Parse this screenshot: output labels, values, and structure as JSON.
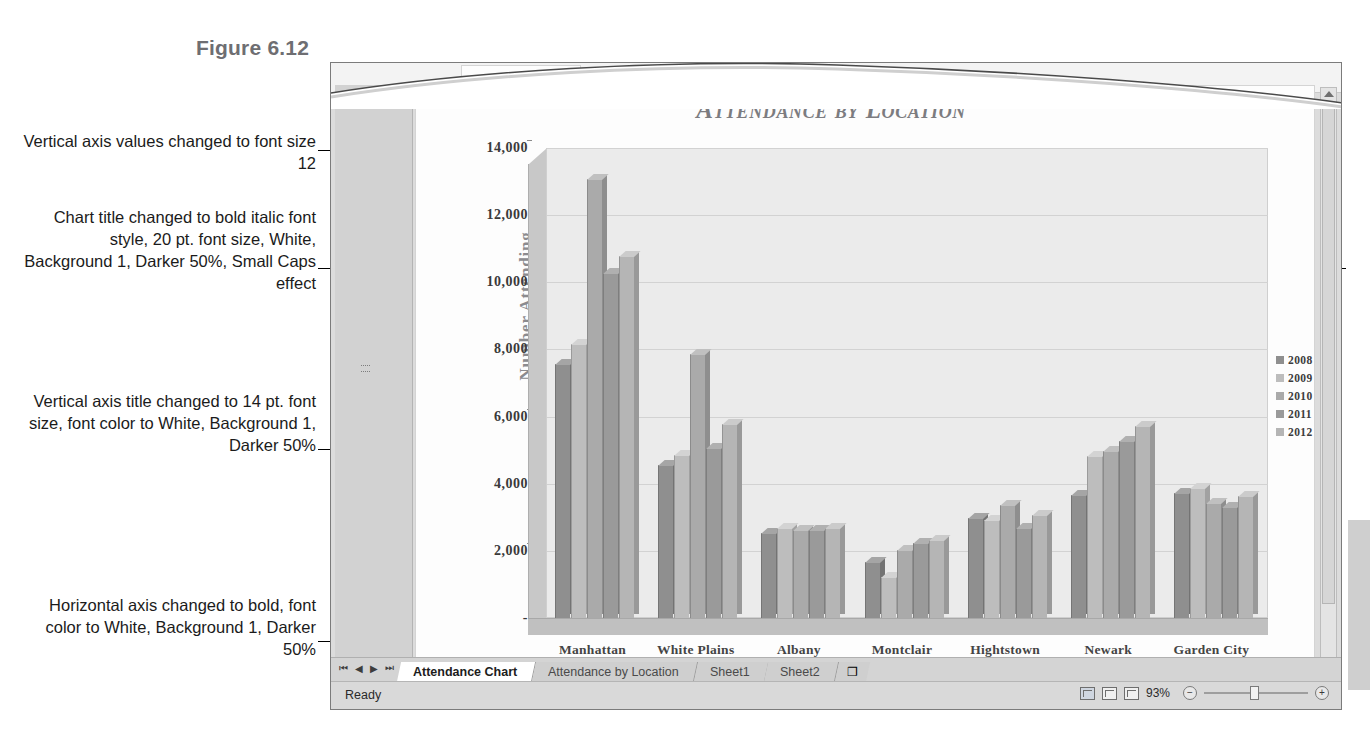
{
  "figure": {
    "label": "Figure 6.12"
  },
  "callouts": [
    {
      "id": "callout-0",
      "text": "Vertical axis values changed to font size 12"
    },
    {
      "id": "callout-1",
      "text": "Chart title changed to bold italic font style, 20 pt. font size, White, Background 1, Darker 50%, Small Caps effect"
    },
    {
      "id": "callout-2",
      "text": "Vertical axis title changed to 14 pt. font size, font color to White, Background 1, Darker 50%"
    },
    {
      "id": "callout-3",
      "text": "Horizontal axis changed to bold, font color to White, Background 1, Darker 50%"
    }
  ],
  "app": {
    "formula_bar": {
      "fx_label": "fx"
    },
    "sheet_tabs": [
      {
        "label": "Attendance Chart",
        "active": true
      },
      {
        "label": "Attendance by Location",
        "active": false
      },
      {
        "label": "Sheet1",
        "active": false
      },
      {
        "label": "Sheet2",
        "active": false
      }
    ],
    "new_sheet_label": "❐",
    "nav_first": "⏮",
    "nav_prev": "◀",
    "nav_next": "▶",
    "nav_last": "⏭",
    "status": {
      "text": "Ready",
      "zoom": "93%",
      "zoom_out": "−",
      "zoom_in": "+"
    }
  },
  "chart_data": {
    "type": "bar",
    "title": "Attendance by Location",
    "xlabel": "",
    "ylabel": "Number Attending",
    "ylim": [
      0,
      14000
    ],
    "yticks": [
      "-",
      "2,000",
      "4,000",
      "6,000",
      "8,000",
      "10,000",
      "12,000",
      "14,000"
    ],
    "grid": true,
    "legend_position": "right",
    "categories": [
      "Manhattan",
      "White Plains",
      "Albany",
      "Montclair",
      "Hightstown",
      "Newark",
      "Garden City"
    ],
    "series": [
      {
        "name": "2008",
        "color": "#8f8f8f",
        "values": [
          7600,
          4600,
          2550,
          1700,
          3000,
          3700,
          3750
        ]
      },
      {
        "name": "2009",
        "color": "#bdbdbd",
        "values": [
          8200,
          4900,
          2700,
          1250,
          2950,
          4850,
          3900
        ]
      },
      {
        "name": "2010",
        "color": "#aaaaaa",
        "values": [
          13100,
          7900,
          2650,
          2050,
          3400,
          5000,
          3450
        ]
      },
      {
        "name": "2011",
        "color": "#9a9a9a",
        "values": [
          10300,
          5100,
          2650,
          2250,
          2700,
          5300,
          3350
        ]
      },
      {
        "name": "2012",
        "color": "#b5b5b5",
        "values": [
          10800,
          5800,
          2700,
          2350,
          3100,
          5750,
          3650
        ]
      }
    ]
  }
}
